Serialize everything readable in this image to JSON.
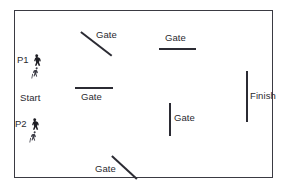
{
  "diagram": {
    "frame": {
      "border_color": "#3a3a42",
      "background": "#ffffff"
    },
    "obstacle_color": "#2b2b33",
    "text_color": "#2a2a30"
  },
  "labels": {
    "start": "Start",
    "finish": "Finish",
    "player_one": "P1",
    "player_two": "P2",
    "gate": "Gate"
  },
  "gates": [
    {
      "id": "gate-1",
      "label": "Gate",
      "orientation": "diagonal",
      "x1": 81,
      "y1": 31,
      "x2": 112,
      "y2": 55,
      "label_x": 96,
      "label_y": 29
    },
    {
      "id": "gate-2",
      "label": "Gate",
      "orientation": "horizontal",
      "x1": 159,
      "y1": 48,
      "x2": 196,
      "y2": 48,
      "label_x": 165,
      "label_y": 32
    },
    {
      "id": "gate-3",
      "label": "Gate",
      "orientation": "horizontal",
      "x1": 75,
      "y1": 87,
      "x2": 113,
      "y2": 87,
      "label_x": 81,
      "label_y": 91
    },
    {
      "id": "gate-4",
      "label": "Gate",
      "orientation": "vertical",
      "x1": 169,
      "y1": 103,
      "x2": 169,
      "y2": 136,
      "label_x": 174,
      "label_y": 112
    },
    {
      "id": "gate-5",
      "label": "Gate",
      "orientation": "diagonal",
      "x1": 112,
      "y1": 155,
      "x2": 137,
      "y2": 178,
      "label_x": 95,
      "label_y": 163
    }
  ],
  "finish": {
    "id": "finish-line",
    "label": "Finish",
    "orientation": "vertical",
    "x1": 246,
    "y1": 71,
    "x2": 246,
    "y2": 122,
    "label_x": 250,
    "label_y": 90
  },
  "start": {
    "id": "start-marker",
    "label": "Start",
    "label_x": 20,
    "label_y": 92
  },
  "players": [
    {
      "id": "player-1",
      "tag": "P1",
      "x": 17,
      "y": 54,
      "icons": [
        "rider-figure-icon",
        "runner-figure-icon"
      ]
    },
    {
      "id": "player-2",
      "tag": "P2",
      "x": 15,
      "y": 118,
      "icons": [
        "rider-figure-icon",
        "runner-figure-icon"
      ]
    }
  ]
}
